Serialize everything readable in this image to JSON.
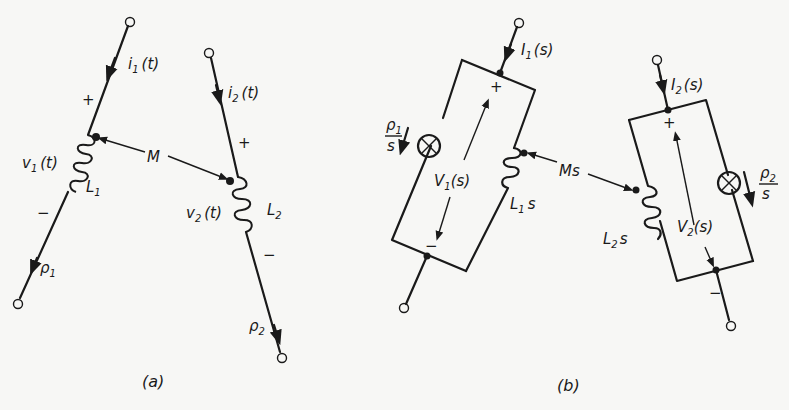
{
  "figure": {
    "panels": [
      {
        "id": "a",
        "caption": "(a)",
        "labels": {
          "i1": "i",
          "i1_sub": "1",
          "i1_arg": "(t)",
          "i2": "i",
          "i2_sub": "2",
          "i2_arg": "(t)",
          "v1": "v",
          "v1_sub": "1",
          "v1_arg": "(t)",
          "v2": "v",
          "v2_sub": "2",
          "v2_arg": "(t)",
          "L1": "L",
          "L1_sub": "1",
          "L2": "L",
          "L2_sub": "2",
          "M": "M",
          "p1": "ρ",
          "p1_sub": "1",
          "p2": "ρ",
          "p2_sub": "2",
          "plus": "+",
          "minus": "−"
        }
      },
      {
        "id": "b",
        "caption": "(b)",
        "labels": {
          "I1": "I",
          "I1_sub": "1",
          "I1_arg": "(s)",
          "I2": "I",
          "I2_sub": "2",
          "I2_arg": "(s)",
          "V1": "V",
          "V1_sub": "1",
          "V1_arg": "(s)",
          "V2": "V",
          "V2_sub": "2",
          "V2_arg": "(s)",
          "L1s": "L",
          "L1s_sub": "1",
          "L1s_s": "s",
          "L2s": "L",
          "L2s_sub": "2",
          "L2s_s": "s",
          "Ms": "Ms",
          "p1_num": "ρ",
          "p1_sub": "1",
          "p1_den": "s",
          "p2_num": "ρ",
          "p2_sub": "2",
          "p2_den": "s",
          "plus": "+",
          "minus": "−"
        }
      }
    ]
  }
}
